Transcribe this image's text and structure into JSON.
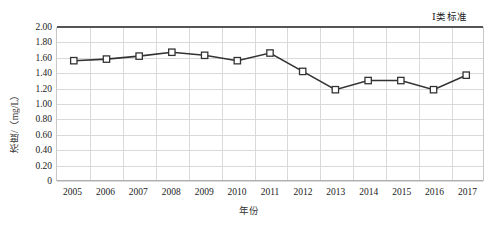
{
  "chart_data": {
    "type": "line",
    "title": "",
    "xlabel": "年份",
    "ylabel": "浓度/（mg/L）",
    "categories": [
      "2005",
      "2006",
      "2007",
      "2008",
      "2009",
      "2010",
      "2011",
      "2012",
      "2013",
      "2014",
      "2015",
      "2016",
      "2017"
    ],
    "series": [
      {
        "name": "浓度",
        "values": [
          1.56,
          1.58,
          1.62,
          1.67,
          1.63,
          1.56,
          1.66,
          1.42,
          1.18,
          1.3,
          1.3,
          1.18,
          1.37
        ],
        "marker": "square-open",
        "color": "#333333"
      }
    ],
    "ylim": [
      0,
      2.0
    ],
    "ytick_labels": [
      "2.00",
      "1.80",
      "1.60",
      "1.40",
      "1.20",
      "1.00",
      "0.80",
      "0.60",
      "0.40",
      "0.20",
      "0"
    ],
    "ytick_values": [
      2.0,
      1.8,
      1.6,
      1.4,
      1.2,
      1.0,
      0.8,
      0.6,
      0.4,
      0.2,
      0
    ],
    "grid": true,
    "legend_position": "none",
    "annotations": [
      {
        "name": "class-i-standard",
        "label": "Ⅰ类标准",
        "value": 2.0,
        "type": "horizontal-threshold-line",
        "color": "#555555"
      }
    ]
  }
}
